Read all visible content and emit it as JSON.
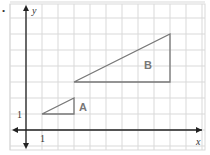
{
  "diagram": {
    "bullet": "•",
    "axes": {
      "x_label": "x",
      "y_label": "y",
      "x_tick": "1",
      "y_tick": "1"
    },
    "grid": {
      "origin_px": [
        26,
        130
      ],
      "unit_px": 16,
      "x_range": [
        -1,
        11
      ],
      "y_range": [
        -1,
        8
      ]
    },
    "shapes": [
      {
        "label": "A",
        "vertices": [
          [
            1,
            1
          ],
          [
            3,
            1
          ],
          [
            3,
            2
          ]
        ]
      },
      {
        "label": "B",
        "vertices": [
          [
            3,
            3
          ],
          [
            9,
            3
          ],
          [
            9,
            6
          ]
        ]
      }
    ],
    "colors": {
      "grid": "#d9d9d9",
      "axis": "#222222",
      "shape": "#777777",
      "label": "#777777"
    }
  }
}
